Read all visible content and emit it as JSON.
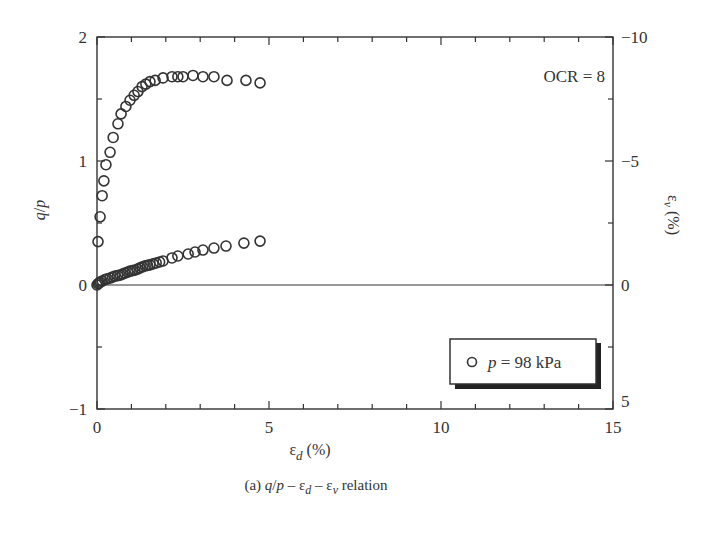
{
  "chart_data": {
    "type": "scatter",
    "title": "",
    "caption": "(a) q/p – εd – εv relation",
    "caption_parts": {
      "prefix": "(a) ",
      "q": "q",
      "slash": "/",
      "p": "p",
      "dash1": " – ε",
      "d": "d",
      "dash2": " – ε",
      "v": "v",
      "suffix": " relation"
    },
    "xlabel": "εd (%)",
    "xlabel_parts": {
      "eps": "ε",
      "sub": "d",
      "unit": " (%)"
    },
    "ylabel_left": "q/p",
    "ylabel_left_parts": {
      "q": "q",
      "slash": "/",
      "p": "p"
    },
    "ylabel_right": "εv (%)",
    "ylabel_right_parts": {
      "eps": "ε",
      "sub": "v",
      "unit": " (%)"
    },
    "xlim": [
      0,
      15
    ],
    "ylim_left": [
      -1,
      2
    ],
    "ylim_right": [
      5,
      -10
    ],
    "x_ticks": [
      "0",
      "5",
      "10",
      "15"
    ],
    "y_left_ticks": [
      "2",
      "1",
      "0",
      "−1"
    ],
    "y_right_ticks": [
      "−10",
      "−5",
      "0",
      "5"
    ],
    "grid": false,
    "annotation": "OCR = 8",
    "legend": {
      "position": "lower right",
      "entries": [
        {
          "marker": "open-circle",
          "label_italic": "p",
          "label": " = 98 kPa"
        }
      ]
    },
    "series": [
      {
        "name": "q/p",
        "axis": "left",
        "marker": "open-circle",
        "x": [
          0.03,
          0.09,
          0.15,
          0.2,
          0.26,
          0.38,
          0.47,
          0.61,
          0.7,
          0.84,
          0.96,
          1.08,
          1.19,
          1.31,
          1.42,
          1.54,
          1.69,
          1.92,
          2.18,
          2.35,
          2.5,
          2.79,
          3.08,
          3.4,
          3.78,
          4.33,
          4.74
        ],
        "y": [
          0.35,
          0.55,
          0.72,
          0.84,
          0.97,
          1.07,
          1.19,
          1.3,
          1.38,
          1.44,
          1.49,
          1.53,
          1.56,
          1.6,
          1.62,
          1.64,
          1.65,
          1.67,
          1.68,
          1.68,
          1.68,
          1.69,
          1.68,
          1.68,
          1.65,
          1.65,
          1.63
        ]
      },
      {
        "name": "εv (%)",
        "axis": "right",
        "marker": "open-circle",
        "x": [
          0,
          0.03,
          0.06,
          0.09,
          0.15,
          0.23,
          0.3,
          0.38,
          0.45,
          0.52,
          0.6,
          0.67,
          0.74,
          0.81,
          0.89,
          0.96,
          1.03,
          1.1,
          1.18,
          1.25,
          1.32,
          1.4,
          1.47,
          1.54,
          1.63,
          1.72,
          1.82,
          1.92,
          2.18,
          2.35,
          2.65,
          2.85,
          3.08,
          3.4,
          3.75,
          4.27,
          4.74
        ],
        "y": [
          0,
          -0.05,
          -0.08,
          -0.12,
          -0.16,
          -0.22,
          -0.25,
          -0.28,
          -0.32,
          -0.36,
          -0.38,
          -0.4,
          -0.44,
          -0.48,
          -0.52,
          -0.56,
          -0.58,
          -0.6,
          -0.64,
          -0.69,
          -0.73,
          -0.77,
          -0.79,
          -0.81,
          -0.85,
          -0.89,
          -0.93,
          -0.97,
          -1.09,
          -1.17,
          -1.25,
          -1.33,
          -1.41,
          -1.49,
          -1.57,
          -1.69,
          -1.77
        ]
      }
    ]
  },
  "colors": {
    "ink": "#333333",
    "background": "#ffffff"
  }
}
